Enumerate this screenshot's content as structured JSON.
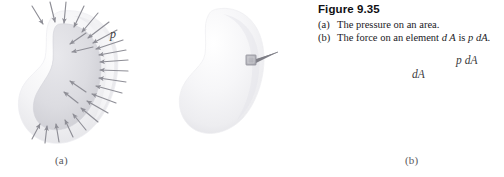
{
  "figure": {
    "caption_title": "Figure 9.35",
    "caption_lines": [
      {
        "marker": "(a)",
        "text": "The pressure on an area.",
        "pre": "The pressure on an area.",
        "italic1": "",
        "mid": "",
        "italic2": "",
        "post": ""
      },
      {
        "marker": "(b)",
        "text": "The force on an element dA is p dA.",
        "pre": "The force on an element ",
        "italic1": "d A",
        "mid": " is ",
        "italic2": "p dA",
        "post": "."
      }
    ]
  },
  "panel_a": {
    "sub_label": "(a)",
    "pressure_symbol": "p",
    "description": "A bean/kidney shaped body with gray arrows pointing inward normal to its surface, representing pressure p acting on the area.",
    "arrow_color": "#8e8e96",
    "body_fill_outer": "#f2f2f4",
    "body_fill_inner": "#dedee2",
    "arrow_count": 25
  },
  "panel_b": {
    "sub_label": "(b)",
    "element_label": "dA",
    "force_label": "p dA",
    "description": "The same bean shaped body with a small square surface element dA and a force vector p dA acting on it.",
    "element_fill": "#b5b5bb",
    "vector_color": "#7e7e86",
    "body_fill": "#f1f1f3"
  },
  "colors": {
    "page_background": "#ffffff",
    "text": "#101014",
    "body_light": "#f2f2f4",
    "body_shadow": "#d8d8dc",
    "arrow_gray": "#8e8e96"
  }
}
